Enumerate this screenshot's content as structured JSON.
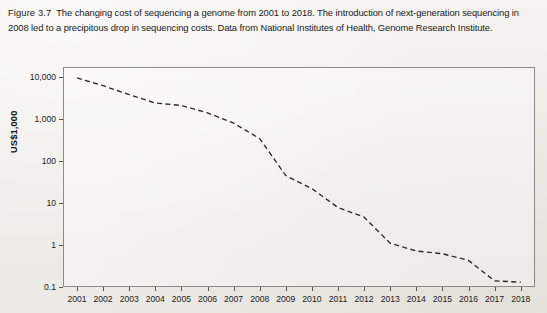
{
  "figure": {
    "label": "Figure 3.7",
    "caption": "The changing cost of sequencing a genome from 2001 to 2018. The introduction of next-generation sequencing in 2008 led to a precipitous drop in sequencing costs. Data from National Institutes of Health, Genome Research Institute."
  },
  "chart_data": {
    "type": "line",
    "title": "",
    "xlabel": "",
    "ylabel": "US$1,000",
    "yscale": "log",
    "ylim": [
      0.1,
      10000
    ],
    "ytick_labels": [
      "10,000",
      "1,000",
      "100",
      "10",
      "1",
      "0.1"
    ],
    "ytick_values": [
      10000,
      1000,
      100,
      10,
      1,
      0.1
    ],
    "xlim": [
      2001,
      2018
    ],
    "grid": false,
    "legend": false,
    "line_style": "dashed",
    "line_color": "#2b2a28",
    "categories": [
      2001,
      2002,
      2003,
      2004,
      2005,
      2006,
      2007,
      2008,
      2009,
      2010,
      2011,
      2012,
      2013,
      2014,
      2015,
      2016,
      2017,
      2018
    ],
    "tick_labels": [
      "2001",
      "2002",
      "2003",
      "2004",
      "2005",
      "2006",
      "2007",
      "2008",
      "2009",
      "2010",
      "2011",
      "2012",
      "2013",
      "2014",
      "2015",
      "2016",
      "2017",
      "2018"
    ],
    "series": [
      {
        "name": "Cost per genome",
        "units": "US$1,000",
        "values": [
          9500,
          6200,
          3800,
          2400,
          2100,
          1400,
          800,
          340,
          45,
          22,
          7.8,
          4.6,
          1.1,
          0.72,
          0.62,
          0.43,
          0.14,
          0.13
        ]
      }
    ],
    "annotations": []
  }
}
